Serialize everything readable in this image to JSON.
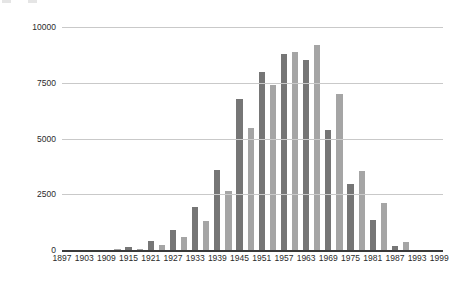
{
  "chart_data": {
    "type": "bar",
    "title": "",
    "subtitle": "",
    "xlabel": "",
    "ylabel": "",
    "ylim": [
      0,
      10000
    ],
    "xlim": [
      1897,
      2000
    ],
    "grid": true,
    "legend": "none",
    "y_ticks": [
      "0",
      "2500",
      "5000",
      "7500",
      "10000"
    ],
    "y_tick_values": [
      0,
      2500,
      5000,
      7500,
      10000
    ],
    "x_tick_labels": [
      "1897",
      "1903",
      "1909",
      "1915",
      "1921",
      "1927",
      "1933",
      "1939",
      "1945",
      "1951",
      "1957",
      "1963",
      "1969",
      "1975",
      "1981",
      "1987",
      "1993",
      "1999"
    ],
    "x_tick_values": [
      1897,
      1903,
      1909,
      1915,
      1921,
      1927,
      1933,
      1939,
      1945,
      1951,
      1957,
      1963,
      1969,
      1975,
      1981,
      1987,
      1993,
      1999
    ],
    "bar_colors": {
      "dark": "#767676",
      "light": "#a5a5a5"
    },
    "categories": [
      1897,
      1900,
      1903,
      1906,
      1909,
      1912,
      1915,
      1918,
      1921,
      1924,
      1927,
      1930,
      1933,
      1936,
      1939,
      1942,
      1945,
      1948,
      1951,
      1954,
      1957,
      1960,
      1963,
      1966,
      1969,
      1972,
      1975,
      1978,
      1981,
      1984,
      1987,
      1990,
      1993,
      1996,
      1999
    ],
    "values": [
      0,
      0,
      0,
      0,
      0,
      50,
      150,
      60,
      400,
      230,
      900,
      570,
      1950,
      1300,
      3600,
      2650,
      6750,
      5450,
      8000,
      7400,
      8800,
      8900,
      8500,
      9200,
      5400,
      7000,
      2950,
      3550,
      1350,
      2100,
      200,
      350,
      0,
      0,
      0
    ],
    "bars": [
      {
        "x": 1897,
        "value": 0,
        "shade": "dark"
      },
      {
        "x": 1900,
        "value": 0,
        "shade": "light"
      },
      {
        "x": 1903,
        "value": 0,
        "shade": "dark"
      },
      {
        "x": 1906,
        "value": 0,
        "shade": "light"
      },
      {
        "x": 1909,
        "value": 0,
        "shade": "dark"
      },
      {
        "x": 1912,
        "value": 50,
        "shade": "light"
      },
      {
        "x": 1915,
        "value": 150,
        "shade": "dark"
      },
      {
        "x": 1918,
        "value": 60,
        "shade": "light"
      },
      {
        "x": 1921,
        "value": 400,
        "shade": "dark"
      },
      {
        "x": 1924,
        "value": 230,
        "shade": "light"
      },
      {
        "x": 1927,
        "value": 900,
        "shade": "dark"
      },
      {
        "x": 1930,
        "value": 570,
        "shade": "light"
      },
      {
        "x": 1933,
        "value": 1950,
        "shade": "dark"
      },
      {
        "x": 1936,
        "value": 1300,
        "shade": "light"
      },
      {
        "x": 1939,
        "value": 3600,
        "shade": "dark"
      },
      {
        "x": 1942,
        "value": 2650,
        "shade": "light"
      },
      {
        "x": 1945,
        "value": 6750,
        "shade": "dark"
      },
      {
        "x": 1948,
        "value": 5450,
        "shade": "light"
      },
      {
        "x": 1951,
        "value": 8000,
        "shade": "dark"
      },
      {
        "x": 1954,
        "value": 7400,
        "shade": "light"
      },
      {
        "x": 1957,
        "value": 8800,
        "shade": "dark"
      },
      {
        "x": 1960,
        "value": 8900,
        "shade": "light"
      },
      {
        "x": 1963,
        "value": 8500,
        "shade": "dark"
      },
      {
        "x": 1966,
        "value": 9200,
        "shade": "light"
      },
      {
        "x": 1969,
        "value": 5400,
        "shade": "dark"
      },
      {
        "x": 1972,
        "value": 7000,
        "shade": "light"
      },
      {
        "x": 1975,
        "value": 2950,
        "shade": "dark"
      },
      {
        "x": 1978,
        "value": 3550,
        "shade": "light"
      },
      {
        "x": 1981,
        "value": 1350,
        "shade": "dark"
      },
      {
        "x": 1984,
        "value": 2100,
        "shade": "light"
      },
      {
        "x": 1987,
        "value": 200,
        "shade": "dark"
      },
      {
        "x": 1990,
        "value": 350,
        "shade": "light"
      },
      {
        "x": 1993,
        "value": 0,
        "shade": "dark"
      },
      {
        "x": 1996,
        "value": 0,
        "shade": "light"
      },
      {
        "x": 1999,
        "value": 0,
        "shade": "dark"
      }
    ]
  }
}
